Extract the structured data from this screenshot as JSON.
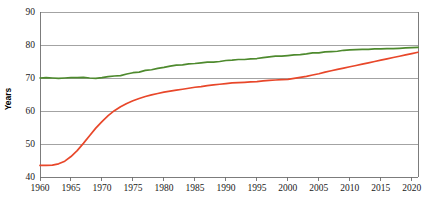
{
  "chart_data": {
    "type": "line",
    "title": "",
    "subtitle": "",
    "xlabel": "",
    "ylabel": "Years",
    "xlim": [
      1960,
      2021
    ],
    "ylim": [
      40,
      90
    ],
    "grid": true,
    "grid_axis": "y",
    "legend": "none",
    "x_ticks": [
      1960,
      1965,
      1970,
      1975,
      1980,
      1985,
      1990,
      1995,
      2000,
      2005,
      2010,
      2015,
      2020
    ],
    "x_tick_labels": [
      "1960",
      "1965",
      "1970",
      "1975",
      "1980",
      "1985",
      "1990",
      "1995",
      "2000",
      "2005",
      "2010",
      "2015",
      "2020"
    ],
    "y_ticks": [
      40,
      50,
      60,
      70,
      80,
      90
    ],
    "y_tick_labels": [
      "40",
      "50",
      "60",
      "70",
      "80",
      "90"
    ],
    "x": [
      1960,
      1961,
      1962,
      1963,
      1964,
      1965,
      1966,
      1967,
      1968,
      1969,
      1970,
      1971,
      1972,
      1973,
      1974,
      1975,
      1976,
      1977,
      1978,
      1979,
      1980,
      1981,
      1982,
      1983,
      1984,
      1985,
      1986,
      1987,
      1988,
      1989,
      1990,
      1991,
      1992,
      1993,
      1994,
      1995,
      1996,
      1997,
      1998,
      1999,
      2000,
      2001,
      2002,
      2003,
      2004,
      2005,
      2006,
      2007,
      2008,
      2009,
      2010,
      2011,
      2012,
      2013,
      2014,
      2015,
      2016,
      2017,
      2018,
      2019,
      2020,
      2021
    ],
    "series": [
      {
        "name": "green-series",
        "color": "#4e8a2e",
        "values": [
          70.0,
          70.1,
          70.0,
          69.9,
          70.0,
          70.1,
          70.1,
          70.2,
          70.0,
          69.9,
          70.1,
          70.4,
          70.6,
          70.7,
          71.2,
          71.6,
          71.8,
          72.3,
          72.5,
          72.9,
          73.2,
          73.6,
          73.9,
          74.0,
          74.3,
          74.4,
          74.6,
          74.8,
          74.8,
          75.0,
          75.3,
          75.4,
          75.6,
          75.6,
          75.8,
          75.9,
          76.2,
          76.4,
          76.6,
          76.6,
          76.8,
          77.0,
          77.1,
          77.3,
          77.6,
          77.6,
          77.9,
          78.0,
          78.1,
          78.4,
          78.5,
          78.6,
          78.7,
          78.7,
          78.8,
          78.8,
          78.9,
          78.9,
          79.0,
          79.1,
          79.2,
          79.3
        ]
      },
      {
        "name": "red-series",
        "color": "#e8472a",
        "values": [
          43.5,
          43.5,
          43.6,
          44.0,
          44.8,
          46.2,
          48.0,
          50.2,
          52.5,
          54.8,
          56.8,
          58.6,
          60.1,
          61.3,
          62.3,
          63.1,
          63.8,
          64.4,
          64.9,
          65.3,
          65.7,
          66.0,
          66.3,
          66.6,
          66.9,
          67.2,
          67.4,
          67.7,
          67.9,
          68.1,
          68.3,
          68.5,
          68.6,
          68.7,
          68.8,
          68.9,
          69.1,
          69.3,
          69.4,
          69.5,
          69.6,
          69.9,
          70.2,
          70.5,
          70.9,
          71.3,
          71.8,
          72.2,
          72.6,
          73.0,
          73.4,
          73.8,
          74.2,
          74.6,
          75.0,
          75.4,
          75.8,
          76.2,
          76.6,
          77.0,
          77.4,
          77.8
        ]
      }
    ]
  }
}
